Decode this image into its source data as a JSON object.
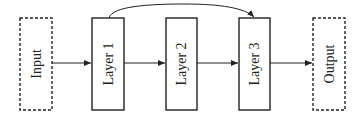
{
  "diagram": {
    "type": "flow",
    "direction": "left-to-right",
    "nodes": [
      {
        "id": "input",
        "label": "Input",
        "style": "dashed"
      },
      {
        "id": "layer1",
        "label": "Layer 1",
        "style": "solid"
      },
      {
        "id": "layer2",
        "label": "Layer 2",
        "style": "solid"
      },
      {
        "id": "layer3",
        "label": "Layer 3",
        "style": "solid"
      },
      {
        "id": "output",
        "label": "Output",
        "style": "dashed"
      }
    ],
    "edges": [
      {
        "from": "input",
        "to": "layer1",
        "kind": "straight"
      },
      {
        "from": "layer1",
        "to": "layer2",
        "kind": "straight"
      },
      {
        "from": "layer2",
        "to": "layer3",
        "kind": "straight"
      },
      {
        "from": "layer3",
        "to": "output",
        "kind": "straight"
      },
      {
        "from": "layer1",
        "to": "layer3",
        "kind": "skip-connection-curved"
      }
    ],
    "colors": {
      "stroke": "#222222",
      "background": "#ffffff"
    }
  }
}
